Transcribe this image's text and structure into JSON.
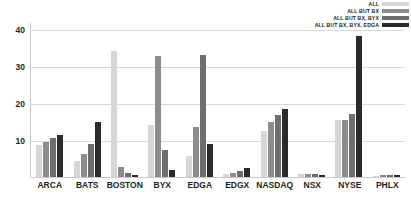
{
  "chart_data": {
    "type": "bar",
    "title": "",
    "subtitle": "",
    "xlabel": "",
    "ylabel": "",
    "ylim": [
      0,
      42
    ],
    "yticks": [
      10,
      20,
      30,
      40
    ],
    "grid": true,
    "legend_position": "top-right",
    "categories": [
      "ARCA",
      "BATS",
      "BOSTON",
      "BYX",
      "EDGA",
      "EDGX",
      "NASDAQ",
      "NSX",
      "NYSE",
      "PHLX"
    ],
    "series": [
      {
        "name": "ALL",
        "color": "#d6d6d4",
        "values": [
          8.8,
          4.3,
          34.1,
          14.0,
          5.7,
          0.8,
          12.4,
          0.7,
          15.4,
          0.4
        ]
      },
      {
        "name": "ALL BUT BX",
        "color": "#8c8c8a",
        "values": [
          9.5,
          6.2,
          2.8,
          32.7,
          13.6,
          1.2,
          14.8,
          0.8,
          15.4,
          0.6
        ]
      },
      {
        "name": "ALL BUT BX, BYX",
        "color": "#6e6e6c",
        "values": [
          10.7,
          8.9,
          1.0,
          7.4,
          33.1,
          1.6,
          16.8,
          0.7,
          17.2,
          0.5
        ]
      },
      {
        "name": "ALL BUT BX, BYX, EDGA",
        "color": "#2b2b2b",
        "values": [
          11.4,
          15.0,
          0.6,
          1.9,
          9.0,
          2.4,
          18.3,
          0.6,
          38.3,
          0.5
        ]
      }
    ]
  }
}
